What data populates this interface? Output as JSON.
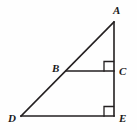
{
  "figure": {
    "kind": "geometry-diagram",
    "background_color": "#fefefe",
    "stroke_color": "#231f20",
    "label_color": "#1a1a1a",
    "stroke_width": 1.6,
    "width": 137,
    "height": 130,
    "labels": {
      "A": "A",
      "B": "B",
      "C": "C",
      "D": "D",
      "E": "E"
    },
    "points": {
      "A": {
        "x": 114,
        "y": 22
      },
      "B": {
        "x": 66,
        "y": 71
      },
      "C": {
        "x": 114,
        "y": 71
      },
      "D": {
        "x": 21,
        "y": 116
      },
      "E": {
        "x": 114,
        "y": 116
      }
    },
    "segments": [
      {
        "name": "DA",
        "from": "D",
        "to": "A"
      },
      {
        "name": "AE",
        "from": "A",
        "to": "E"
      },
      {
        "name": "DE",
        "from": "D",
        "to": "E"
      },
      {
        "name": "BC",
        "from": "B",
        "to": "C"
      }
    ],
    "right_angles": [
      {
        "name": "angle-BCA",
        "vertex": "C",
        "size": 9
      },
      {
        "name": "angle-DEA",
        "vertex": "E",
        "size": 9
      }
    ]
  }
}
